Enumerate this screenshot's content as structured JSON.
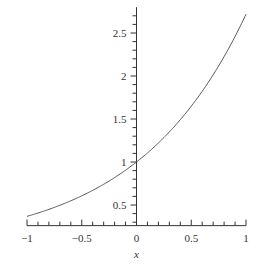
{
  "chart_data": {
    "type": "line",
    "title": "",
    "xlabel": "x",
    "ylabel": "",
    "function": "exp(x)",
    "series": [
      {
        "name": "exp(x)",
        "x": [
          -1,
          -0.75,
          -0.5,
          -0.25,
          0,
          0.25,
          0.5,
          0.75,
          1
        ],
        "values": [
          0.368,
          0.472,
          0.607,
          0.779,
          1,
          1.284,
          1.649,
          2.117,
          2.718
        ]
      }
    ],
    "xlim": [
      -1,
      1
    ],
    "ylim": [
      0.26,
      2.8
    ],
    "x_ticks": [
      "-1",
      "-0.5",
      "0",
      "0.5",
      "1"
    ],
    "y_ticks": [
      "0.5",
      "1",
      "1.5",
      "2",
      "2.5"
    ],
    "grid": false,
    "legend": "none",
    "colors": {
      "line": "#555555",
      "axis": "#333333"
    }
  }
}
